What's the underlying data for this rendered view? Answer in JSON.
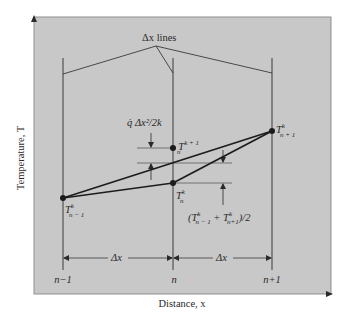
{
  "colors": {
    "panel": "#c8c8c8",
    "panel_border": "#8f8f8f",
    "line": "#3a3a3a",
    "thick_line": "#1c1c1c",
    "text": "#2a2a2a",
    "background": "#ffffff"
  },
  "axes": {
    "y_label": "Temperature, T",
    "x_label": "Distance, x"
  },
  "callout": {
    "label": "Δx lines"
  },
  "nodes": {
    "x_labels": [
      "n−1",
      "n",
      "n+1"
    ]
  },
  "spacing": {
    "left": "Δx",
    "right": "Δx"
  },
  "points": {
    "t_prev": {
      "base": "T",
      "sup": "k",
      "sub": "n − 1"
    },
    "t_curr": {
      "base": "T",
      "sup": "k",
      "sub": "n"
    },
    "t_next_time": {
      "base": "T",
      "sup": "k + 1",
      "sub": "n"
    },
    "t_next_space": {
      "base": "T",
      "sup": "k",
      "sub": "n + 1"
    }
  },
  "annotations": {
    "generation_term": "q̇ Δx²/2k",
    "average": {
      "open": "(",
      "t1_base": "T",
      "t1_sup": "k",
      "t1_sub": "n − 1",
      "plus": " + ",
      "t2_base": "T",
      "t2_sup": "k",
      "t2_sub": "n+1",
      "close": ")/2"
    }
  }
}
